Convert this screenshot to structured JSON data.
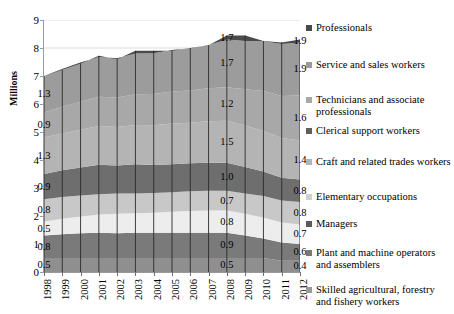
{
  "chart_data": {
    "type": "area",
    "stacked": true,
    "title": "",
    "xlabel": "",
    "ylabel": "Millions",
    "ylim": [
      0,
      9
    ],
    "yticks": [
      "0",
      "1",
      "2",
      "3",
      "4",
      "5",
      "6",
      "7",
      "8",
      "9"
    ],
    "grid": true,
    "legend_position": "right",
    "categories": [
      "1998",
      "1999",
      "2000",
      "2001",
      "2002",
      "2003",
      "2004",
      "2005",
      "2006",
      "2007",
      "2008",
      "2009",
      "2010",
      "2011",
      "2012"
    ],
    "series": [
      {
        "name": "Skilled agricultural, forestry and fishery workers",
        "color": "#8f8f8f",
        "values": [
          0.5,
          0.5,
          0.5,
          0.5,
          0.5,
          0.5,
          0.5,
          0.5,
          0.5,
          0.5,
          0.5,
          0.5,
          0.5,
          0.4,
          0.4
        ],
        "labels": {
          "1998": "0.5",
          "2008": "0.5",
          "2012": "0.4"
        }
      },
      {
        "name": "Plant and machine operators and assemblers",
        "color": "#7a7a7a",
        "values": [
          0.8,
          0.85,
          0.88,
          0.9,
          0.88,
          0.9,
          0.9,
          0.9,
          0.9,
          0.9,
          0.9,
          0.8,
          0.7,
          0.65,
          0.6
        ],
        "labels": {
          "1998": "0.8",
          "2008": "0.9",
          "2012": "0.6"
        }
      },
      {
        "name": "Managers",
        "color": "#ededed",
        "values": [
          0.5,
          0.55,
          0.6,
          0.65,
          0.7,
          0.7,
          0.72,
          0.75,
          0.78,
          0.8,
          0.8,
          0.78,
          0.75,
          0.72,
          0.7
        ],
        "labels": {
          "1998": "0.5",
          "2008": "0.8",
          "2012": "0.7"
        }
      },
      {
        "name": "Elementary occupations",
        "color": "#c8c8c8",
        "values": [
          0.8,
          0.78,
          0.75,
          0.73,
          0.72,
          0.7,
          0.7,
          0.7,
          0.7,
          0.7,
          0.7,
          0.72,
          0.76,
          0.78,
          0.8
        ],
        "labels": {
          "1998": "0.8",
          "2008": "0.7",
          "2012": "0.8"
        }
      },
      {
        "name": "Craft and related trades workers",
        "color": "#6e6e6e",
        "values": [
          0.9,
          0.95,
          1.0,
          1.05,
          1.0,
          1.05,
          1.0,
          1.0,
          1.0,
          1.0,
          1.0,
          0.95,
          0.88,
          0.82,
          0.8
        ],
        "labels": {
          "1998": "0.9",
          "2008": "1.0",
          "2012": "0.8"
        }
      },
      {
        "name": "Clerical support workers",
        "color": "#b4b4b4",
        "values": [
          1.3,
          1.32,
          1.35,
          1.38,
          1.38,
          1.4,
          1.42,
          1.45,
          1.45,
          1.48,
          1.5,
          1.48,
          1.45,
          1.42,
          1.4
        ],
        "labels": {
          "1998": "1.3",
          "2008": "1.5",
          "2012": "1.4"
        }
      },
      {
        "name": "Technicians and associate professionals",
        "color": "#a8a8a8",
        "values": [
          0.9,
          0.95,
          1.0,
          1.05,
          1.05,
          1.1,
          1.12,
          1.15,
          1.15,
          1.18,
          1.2,
          1.3,
          1.42,
          1.5,
          1.6
        ],
        "labels": {
          "1998": "0.9",
          "2008": "1.2",
          "2012": "1.6"
        }
      },
      {
        "name": "Service and sales workers",
        "color": "#9c9c9c",
        "values": [
          1.3,
          1.35,
          1.4,
          1.42,
          1.4,
          1.45,
          1.45,
          1.48,
          1.5,
          1.55,
          1.7,
          1.72,
          1.78,
          1.85,
          1.9
        ],
        "labels": {
          "1998": "1.3",
          "2008": "1.7",
          "2012": "1.9"
        }
      },
      {
        "name": "Professionals",
        "color": "#4a4a4a",
        "values": [
          0.0,
          0.0,
          0.0,
          0.0,
          0.0,
          0.0,
          0.0,
          0.0,
          0.0,
          0.0,
          0.0,
          0.0,
          0.0,
          0.0,
          0.0
        ],
        "labels": {}
      }
    ],
    "legend_entries": [
      {
        "label": "Professionals",
        "color": "#4a4a4a"
      },
      {
        "label": "Service and sales workers",
        "color": "#9c9c9c"
      },
      {
        "label": "Technicians and associate professionals",
        "color": "#a8a8a8"
      },
      {
        "label": "Clerical support workers",
        "color": "#5f5f5f"
      },
      {
        "label": "Craft and related trades workers",
        "color": "#b4b4b4"
      },
      {
        "label": "Elementary occupations",
        "color": "#cfcfcf"
      },
      {
        "label": "Managers",
        "color": "#5a5a5a"
      },
      {
        "label": "Plant and machine operators and assemblers",
        "color": "#787878"
      },
      {
        "label": "Skilled agricultural, forestry and fishery workers",
        "color": "#9a9a9a"
      }
    ]
  }
}
